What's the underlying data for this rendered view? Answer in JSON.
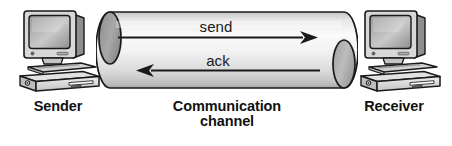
{
  "figure": {
    "type": "network-communication-diagram",
    "nodes": [
      {
        "id": "sender",
        "caption": "Sender",
        "icon": "desktop-computer-icon"
      },
      {
        "id": "channel",
        "caption": "Communication\nchannel",
        "icon": "cylinder-channel-icon"
      },
      {
        "id": "receiver",
        "caption": "Receiver",
        "icon": "desktop-computer-icon"
      }
    ],
    "messages": [
      {
        "id": "send",
        "label": "send",
        "direction": "left-to-right",
        "from": "sender",
        "to": "receiver"
      },
      {
        "id": "ack",
        "label": "ack",
        "direction": "right-to-left",
        "from": "receiver",
        "to": "sender"
      }
    ],
    "colors": {
      "stroke": "#1a1a1a",
      "text": "#111111",
      "tube_light": "#f4f4f4",
      "tube_mid": "#dcdcdc",
      "tube_shadow": "#b4b4b4",
      "cap_fill": "#9b9b9b",
      "background": "#ffffff"
    }
  }
}
